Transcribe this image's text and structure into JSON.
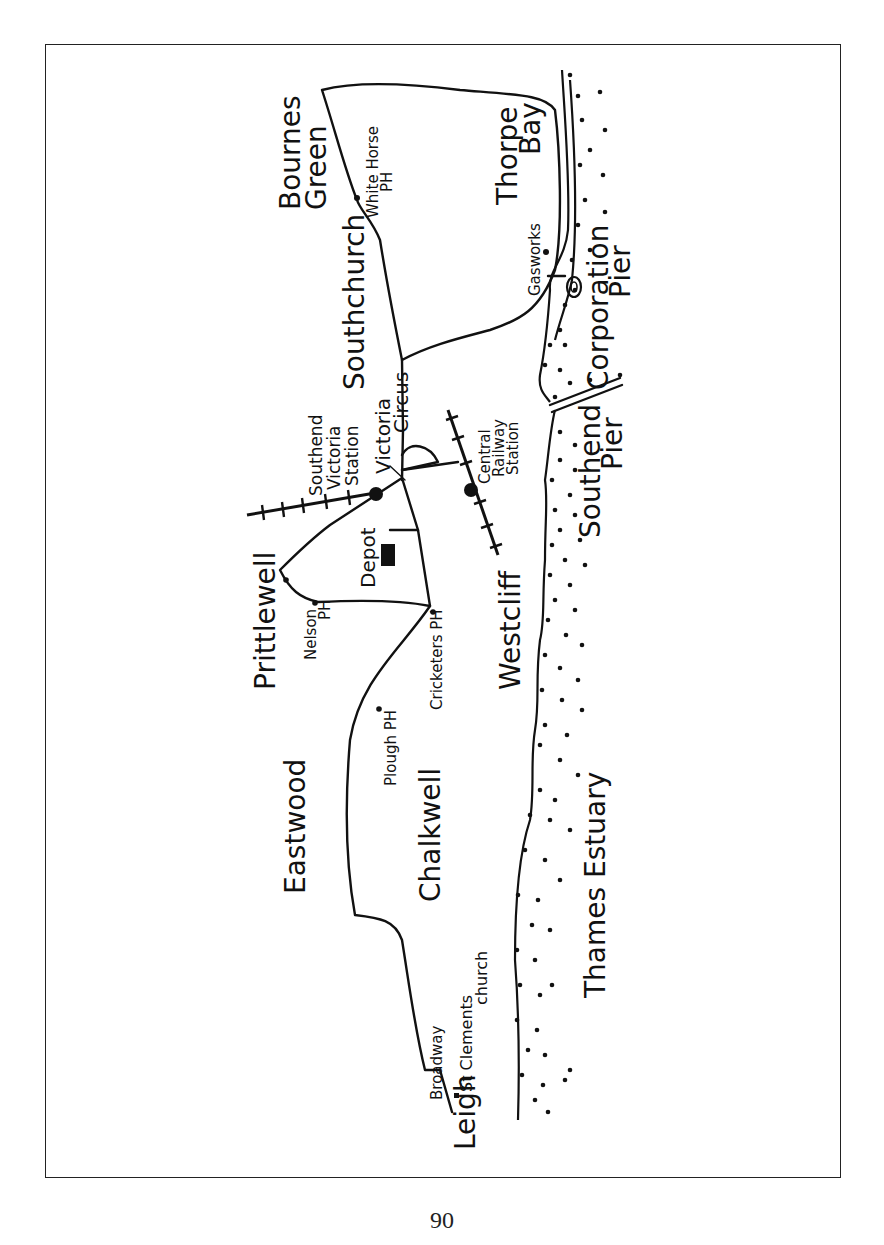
{
  "map": {
    "orientation": "rotated 90 degrees counter-clockwise",
    "colors": {
      "ink": "#111111",
      "paper": "#ffffff"
    },
    "labels": {
      "bournes_green": [
        "Bournes",
        "Green"
      ],
      "white_horse": [
        "White Horse",
        "PH"
      ],
      "thorpe_bay": [
        "Thorpe",
        "Bay"
      ],
      "southchurch": "Southchurch",
      "gasworks": "Gasworks",
      "corporation_pier": [
        "Corporation",
        "Pier"
      ],
      "southend_victoria_station": [
        "Southend",
        "Victoria",
        "Station"
      ],
      "victoria_circus": [
        "Victoria",
        "Circus"
      ],
      "central_railway_station": [
        "Central",
        "Railway",
        "Station"
      ],
      "southend_pier": [
        "Southend",
        "Pier"
      ],
      "prittlewell": "Prittlewell",
      "depot": "Depot",
      "nelson_ph": [
        "Nelson",
        "PH"
      ],
      "cricketers_ph": "Cricketers PH",
      "westcliff": "Westcliff",
      "plough_ph": "Plough PH",
      "eastwood": "Eastwood",
      "chalkwell": "Chalkwell",
      "thames_estuary": "Thames Estuary",
      "st_clements_church": [
        "St Clements",
        "church"
      ],
      "broadway": "Broadway",
      "leigh": "Leigh"
    }
  },
  "page": {
    "number": "90"
  }
}
